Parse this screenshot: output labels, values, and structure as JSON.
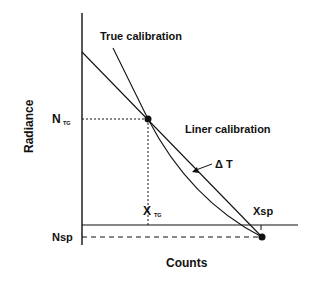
{
  "diagram": {
    "title_labels": {
      "true_calibration": "True calibration",
      "linear_calibration": "Liner calibration",
      "delta_t": "Δ T"
    },
    "axes": {
      "y_label": "Radiance",
      "x_label": "Counts"
    },
    "y_ticks": {
      "n_tg_main": "N",
      "n_tg_sub": "TG",
      "nsp": "Nsp"
    },
    "x_ticks": {
      "x_tg_main": "X",
      "x_tg_sub": "TG",
      "xsp": "Xsp"
    },
    "colors": {
      "ink": "#111111",
      "background": "#ffffff"
    }
  }
}
